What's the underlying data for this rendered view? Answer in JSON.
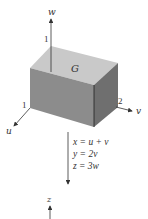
{
  "diagram": {
    "region_label": "G",
    "axes": {
      "w": {
        "label": "w",
        "tick": "1"
      },
      "u": {
        "label": "u",
        "tick": "1"
      },
      "v": {
        "label": "v",
        "tick": "2"
      },
      "z": {
        "label": "z"
      }
    },
    "transformation": [
      "x = u + v",
      "y = 2v",
      "z = 3w"
    ],
    "colors": {
      "top_face": "#c9c9c9",
      "front_face": "#8c8c8c",
      "side_face": "#6f6f6f",
      "line": "#333333"
    }
  }
}
